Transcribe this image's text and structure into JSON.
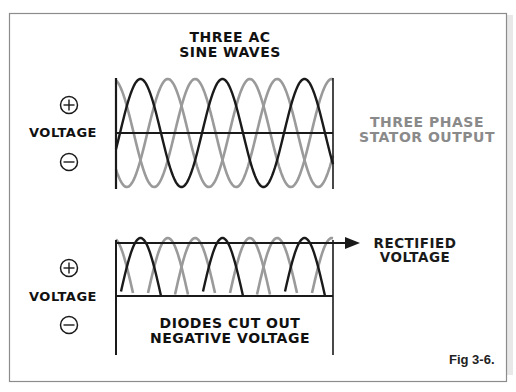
{
  "figure": {
    "label": "Fig 3-6.",
    "frame_color": "#8c8c8c",
    "shadow_color": "#e4e4e4"
  },
  "top_panel": {
    "title_line1": "THREE AC",
    "title_line2": "SINE WAVES",
    "side_label_line1": "THREE PHASE",
    "side_label_line2": "STATOR OUTPUT",
    "side_label_color": "#8a8a8a",
    "axis_label": "VOLTAGE",
    "plus_icon": "plus-circle-icon",
    "minus_icon": "minus-circle-icon"
  },
  "bottom_panel": {
    "arrow_label_line1": "RECTIFIED",
    "arrow_label_line2": "VOLTAGE",
    "caption_line1": "DIODES CUT OUT",
    "caption_line2": "NEGATIVE VOLTAGE",
    "axis_label": "VOLTAGE",
    "plus_icon": "plus-circle-icon",
    "minus_icon": "minus-circle-icon"
  },
  "chart_data": [
    {
      "type": "line",
      "title": "THREE AC SINE WAVES",
      "ylabel": "VOLTAGE",
      "annotation": "THREE PHASE STATOR OUTPUT",
      "x_range_cycles": [
        0,
        2.65
      ],
      "ylim": [
        -1,
        1
      ],
      "series": [
        {
          "name": "phase-A",
          "color": "#1a1a1a",
          "phase_deg": 0,
          "amplitude": 1
        },
        {
          "name": "phase-B",
          "color": "#9a9a9a",
          "phase_deg": 120,
          "amplitude": 1
        },
        {
          "name": "phase-C",
          "color": "#9a9a9a",
          "phase_deg": 240,
          "amplitude": 1
        }
      ],
      "geometry": {
        "x0": 116,
        "x1": 333,
        "zero_y": 133,
        "amplitude_px": 54,
        "period_px": 82,
        "phase_origin_x": 120
      }
    },
    {
      "type": "line",
      "title": "RECTIFIED VOLTAGE",
      "ylabel": "VOLTAGE",
      "annotation": "DIODES CUT OUT NEGATIVE VOLTAGE",
      "ylim": [
        0,
        1
      ],
      "series": [
        {
          "name": "phase-A-rectified",
          "color": "#1a1a1a",
          "phase_deg": 0
        },
        {
          "name": "phase-B-rectified",
          "color": "#9a9a9a",
          "phase_deg": 120
        },
        {
          "name": "phase-C-rectified",
          "color": "#9a9a9a",
          "phase_deg": 240
        }
      ],
      "geometry": {
        "x0": 116,
        "x1": 333,
        "base_y": 296,
        "top_y": 243,
        "peak_y": 238,
        "period_px": 82,
        "phase_origin_x": 120,
        "axis_bottom_y": 355,
        "arrow_end_x": 345
      }
    }
  ]
}
